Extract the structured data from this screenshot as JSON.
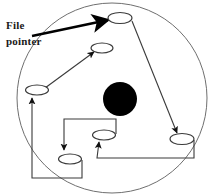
{
  "figure": {
    "type": "diagram",
    "width": 220,
    "height": 196,
    "background_color": "#ffffff",
    "line_color": "#2b2b2b",
    "fill_color": "#000000",
    "text_color": "#1a1a1a"
  },
  "labels": {
    "file_pointer_line1": "File",
    "file_pointer_line2": "pointer"
  },
  "disk": {
    "name": "disk-platter-circle",
    "cx": 112,
    "cy": 98,
    "r": 95,
    "stroke": "#6f6f6f"
  },
  "hub": {
    "name": "disk-spindle-hub",
    "cx": 120,
    "cy": 99,
    "r": 17,
    "fill": "#000000"
  },
  "blocks": [
    {
      "name": "disk-block-1",
      "cx": 120,
      "cy": 18,
      "rx": 12,
      "ry": 5.5
    },
    {
      "name": "disk-block-2",
      "cx": 102,
      "cy": 48,
      "rx": 11,
      "ry": 5
    },
    {
      "name": "disk-block-3",
      "cx": 37,
      "cy": 90,
      "rx": 11.5,
      "ry": 5
    },
    {
      "name": "disk-block-4",
      "cx": 104,
      "cy": 135,
      "rx": 11.5,
      "ry": 5
    },
    {
      "name": "disk-block-5",
      "cx": 70,
      "cy": 159,
      "rx": 11.5,
      "ry": 5
    },
    {
      "name": "disk-block-6",
      "cx": 182,
      "cy": 139,
      "rx": 12,
      "ry": 5.5
    }
  ],
  "connections": [
    {
      "name": "pointer-arrow-to-block-1",
      "from": "file-pointer-label",
      "to": "disk-block-1"
    },
    {
      "name": "link-block-1-to-block-6",
      "from": "disk-block-1",
      "to": "disk-block-6"
    },
    {
      "name": "link-block-6-to-block-4",
      "from": "disk-block-6",
      "to": "disk-block-4"
    },
    {
      "name": "link-block-4-to-block-5",
      "from": "disk-block-4",
      "to": "disk-block-5"
    },
    {
      "name": "link-block-5-to-block-3",
      "from": "disk-block-5",
      "to": "disk-block-3"
    },
    {
      "name": "link-block-3-to-block-2",
      "from": "disk-block-3",
      "to": "disk-block-2"
    }
  ]
}
